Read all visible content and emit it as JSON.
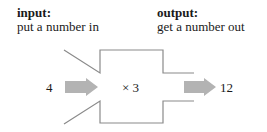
{
  "input": {
    "heading": "input:",
    "description": "put a number in",
    "value": "4"
  },
  "output": {
    "heading": "output:",
    "description": "get a number out",
    "value": "12"
  },
  "machine": {
    "operation": "× 3"
  },
  "colors": {
    "outline": "#8a8a8a",
    "arrow": "#b3b3b3",
    "text": "#1a1a1a"
  }
}
